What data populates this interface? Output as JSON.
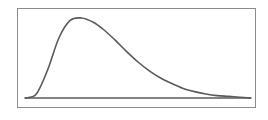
{
  "chart_data": {
    "type": "line",
    "title": "",
    "xlabel": "",
    "ylabel": "",
    "grid": false,
    "legend": null,
    "x": [
      0,
      0.5,
      1,
      1.5,
      2,
      2.5,
      3,
      3.5,
      4,
      4.5,
      5,
      5.5,
      6,
      6.5,
      7,
      7.5,
      8,
      8.5,
      9,
      9.5,
      10
    ],
    "series": [
      {
        "name": "density",
        "values": [
          0.0,
          0.05,
          0.35,
          0.75,
          0.97,
          1.0,
          0.95,
          0.85,
          0.72,
          0.58,
          0.45,
          0.34,
          0.25,
          0.18,
          0.12,
          0.08,
          0.05,
          0.03,
          0.02,
          0.01,
          0.0
        ]
      }
    ],
    "xlim": [
      0,
      10
    ],
    "ylim": [
      0,
      1.05
    ],
    "colors": {
      "line": "#5a5a5a",
      "frame": "#8c8c8c",
      "baseline": "#5a5a5a"
    }
  }
}
